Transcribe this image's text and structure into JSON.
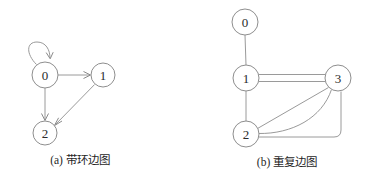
{
  "figure": {
    "background_color": "#ffffff",
    "stroke_color": "#9a9a9a",
    "node_fill": "#ffffff",
    "node_stroke": "#8e8e8e",
    "label_color": "#2b2b2b",
    "caption_color": "#1f1f1f"
  },
  "panel_a": {
    "caption": "(a) 带环边图",
    "graph_type": "directed",
    "nodes": [
      {
        "id": "a0",
        "label": "0",
        "cx": 45,
        "cy": 75,
        "r": 13
      },
      {
        "id": "a1",
        "label": "1",
        "cx": 103,
        "cy": 75,
        "r": 12
      },
      {
        "id": "a2",
        "label": "2",
        "cx": 45,
        "cy": 133,
        "r": 12
      }
    ],
    "edges": [
      {
        "from": "0",
        "to": "0",
        "kind": "self-loop",
        "directed": true
      },
      {
        "from": "0",
        "to": "1",
        "kind": "straight",
        "directed": true
      },
      {
        "from": "0",
        "to": "2",
        "kind": "straight",
        "directed": true
      },
      {
        "from": "1",
        "to": "2",
        "kind": "straight",
        "directed": true
      }
    ]
  },
  "panel_b": {
    "caption": "(b) 重复边图",
    "graph_type": "undirected-multigraph",
    "nodes": [
      {
        "id": "b0",
        "label": "0",
        "cx": 245,
        "cy": 22,
        "r": 13
      },
      {
        "id": "b1",
        "label": "1",
        "cx": 246,
        "cy": 78,
        "r": 13
      },
      {
        "id": "b3",
        "label": "3",
        "cx": 338,
        "cy": 78,
        "r": 13
      },
      {
        "id": "b2",
        "label": "2",
        "cx": 246,
        "cy": 134,
        "r": 13
      }
    ],
    "edges": [
      {
        "from": "0",
        "to": "1",
        "kind": "straight",
        "multiplicity": 1
      },
      {
        "from": "1",
        "to": "3",
        "kind": "parallel-pair",
        "multiplicity": 2
      },
      {
        "from": "1",
        "to": "2",
        "kind": "straight",
        "multiplicity": 1
      },
      {
        "from": "2",
        "to": "3",
        "kind": "straight-diagonal",
        "multiplicity": 1
      },
      {
        "from": "2",
        "to": "3",
        "kind": "curved-arc",
        "multiplicity": 1
      },
      {
        "from": "2",
        "to": "3",
        "kind": "rounded-bottom-path",
        "multiplicity": 1
      }
    ]
  }
}
